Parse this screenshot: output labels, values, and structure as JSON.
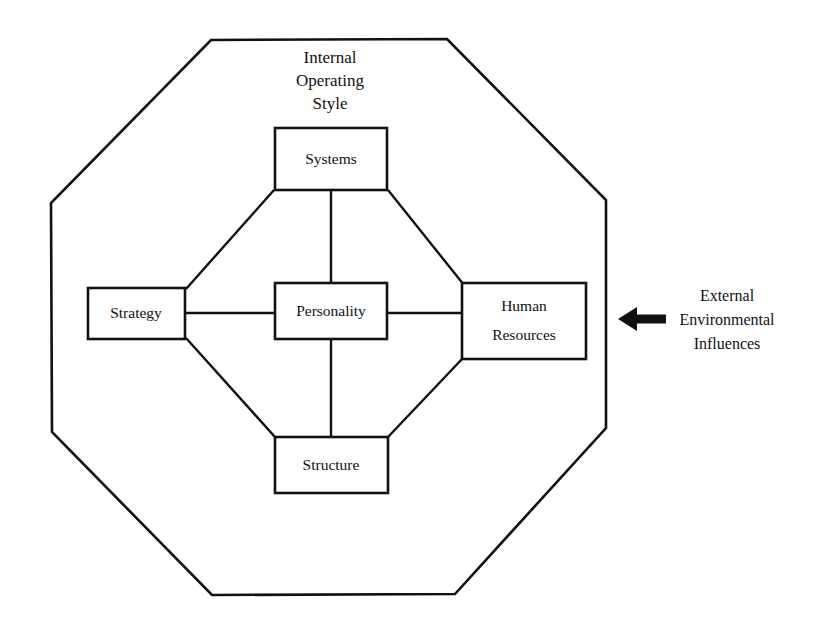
{
  "diagram": {
    "title_lines": [
      "Internal",
      "Operating",
      "Style"
    ],
    "boundary_shape": "octagon",
    "nodes": [
      {
        "id": "systems",
        "label_lines": [
          "Systems"
        ],
        "x": 275,
        "y": 128,
        "w": 112,
        "h": 62
      },
      {
        "id": "strategy",
        "label_lines": [
          "Strategy"
        ],
        "x": 88,
        "y": 288,
        "w": 97,
        "h": 51
      },
      {
        "id": "personality",
        "label_lines": [
          "Personality"
        ],
        "x": 275,
        "y": 283,
        "w": 112,
        "h": 56
      },
      {
        "id": "human-resources",
        "label_lines": [
          "Human",
          "Resources"
        ],
        "x": 462,
        "y": 283,
        "w": 124,
        "h": 76
      },
      {
        "id": "structure",
        "label_lines": [
          "Structure"
        ],
        "x": 275,
        "y": 437,
        "w": 113,
        "h": 56
      }
    ],
    "connections": [
      {
        "from": "strategy",
        "to": "systems",
        "kind": "diagonal"
      },
      {
        "from": "systems",
        "to": "human-resources",
        "kind": "diagonal"
      },
      {
        "from": "strategy",
        "to": "structure",
        "kind": "diagonal"
      },
      {
        "from": "structure",
        "to": "human-resources",
        "kind": "diagonal"
      },
      {
        "from": "systems",
        "to": "personality",
        "kind": "vertical"
      },
      {
        "from": "personality",
        "to": "structure",
        "kind": "vertical"
      },
      {
        "from": "strategy",
        "to": "personality",
        "kind": "horizontal"
      },
      {
        "from": "personality",
        "to": "human-resources",
        "kind": "horizontal"
      }
    ],
    "external": {
      "arrow_direction": "left",
      "label_lines": [
        "External",
        "Environmental",
        "Influences"
      ]
    },
    "colors": {
      "ink": "#111111",
      "background": "#ffffff"
    }
  }
}
